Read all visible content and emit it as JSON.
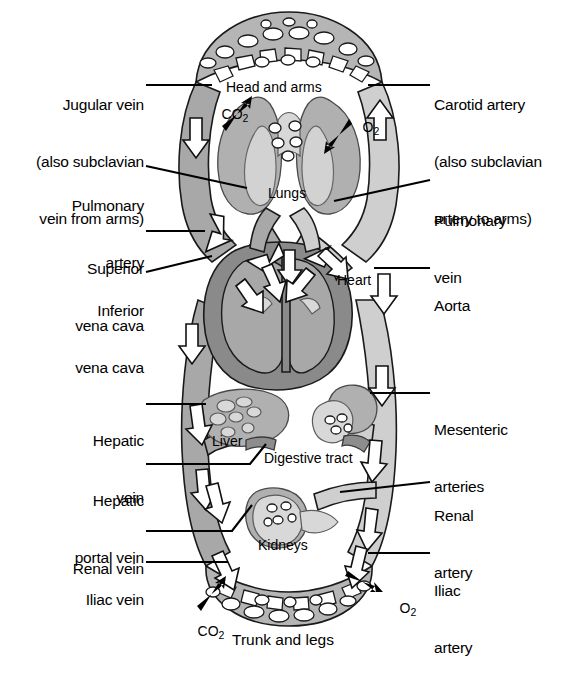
{
  "diagram": {
    "colors": {
      "vein_fill": "#a8a8a8",
      "artery_fill": "#cfcfcf",
      "capillary_fill": "#b5b5b5",
      "organ_mid": "#b0b0b0",
      "organ_dark": "#8d8d8d",
      "organ_light": "#d8d8d8",
      "heart_muscle": "#8a8a8a",
      "heart_chamber": "#a0a0a0",
      "outline": "#1a1a1a",
      "arrow_fill": "#ffffff",
      "text": "#000000",
      "background": "#ffffff"
    }
  },
  "labels": {
    "left": [
      {
        "id": "jugular-vein",
        "lines": [
          "Jugular vein",
          "(also subclavian",
          "vein from arms)"
        ],
        "x": 12,
        "y": 56,
        "line_y": 85,
        "line_x1": 146,
        "line_x2": 210
      },
      {
        "id": "pulmonary-artery",
        "lines": [
          "Pulmonary",
          "artery"
        ],
        "x": 58,
        "y": 160,
        "line_y": 172,
        "line_x1": 146,
        "line_x2": 243
      },
      {
        "id": "superior-vena-cava",
        "lines": [
          "Superior",
          "vena cava"
        ],
        "x": 58,
        "y": 221,
        "line_y": 231,
        "line_x1": 146,
        "line_x2": 205
      },
      {
        "id": "inferior-vena-cava",
        "lines": [
          "Inferior",
          "vena cava"
        ],
        "x": 58,
        "y": 265,
        "line_y": 275,
        "line_x1": 146,
        "line_x2": 211
      },
      {
        "id": "hepatic-vein",
        "lines": [
          "Hepatic",
          "vein"
        ],
        "x": 58,
        "y": 382,
        "line_y": 404,
        "line_x1": 146,
        "line_x2": 205
      },
      {
        "id": "hepatic-portal-vein",
        "lines": [
          "Hepatic",
          "portal vein"
        ],
        "x": 40,
        "y": 451,
        "line_y": 464,
        "line_x1": 146,
        "line_x2": 275
      },
      {
        "id": "renal-vein",
        "lines": [
          "Renal vein"
        ],
        "x": 58,
        "y": 521,
        "line_y": 531,
        "line_x1": 146,
        "line_x2": 240
      },
      {
        "id": "iliac-vein",
        "lines": [
          "Iliac vein"
        ],
        "x": 58,
        "y": 552,
        "line_y": 562,
        "line_x1": 146,
        "line_x2": 228
      }
    ],
    "right": [
      {
        "id": "carotid-artery",
        "lines": [
          "Carotid artery",
          "(also subclavian",
          "artery to arms)"
        ],
        "x": 435,
        "y": 56,
        "line_y": 85,
        "line_x1": 370,
        "line_x2": 430
      },
      {
        "id": "pulmonary-vein",
        "lines": [
          "Pulmonary",
          "vein"
        ],
        "x": 435,
        "y": 180,
        "line_y": 192,
        "line_x1": 340,
        "line_x2": 430
      },
      {
        "id": "aorta",
        "lines": [
          "Aorta"
        ],
        "x": 435,
        "y": 258,
        "line_y": 268,
        "line_x1": 372,
        "line_x2": 430
      },
      {
        "id": "mesenteric-arteries",
        "lines": [
          "Mesenteric",
          "arteries"
        ],
        "x": 435,
        "y": 382,
        "line_y": 393,
        "line_x1": 370,
        "line_x2": 430
      },
      {
        "id": "renal-artery",
        "lines": [
          "Renal",
          "artery"
        ],
        "x": 435,
        "y": 469,
        "line_y": 482,
        "line_x1": 348,
        "line_x2": 430
      },
      {
        "id": "iliac-artery",
        "lines": [
          "Iliac",
          "artery"
        ],
        "x": 435,
        "y": 543,
        "line_y": 553,
        "line_x1": 368,
        "line_x2": 430
      }
    ],
    "internal": [
      {
        "id": "head-and-arms",
        "text": "Head and arms",
        "x": 231,
        "y": 86
      },
      {
        "id": "lungs",
        "text": "Lungs",
        "x": 272,
        "y": 192
      },
      {
        "id": "heart",
        "text": "Heart",
        "x": 339,
        "y": 280
      },
      {
        "id": "liver",
        "text": "Liver",
        "x": 214,
        "y": 440
      },
      {
        "id": "digestive-tract",
        "text": "Digestive tract",
        "x": 267,
        "y": 457
      },
      {
        "id": "kidneys",
        "text": "Kidneys",
        "x": 262,
        "y": 543
      },
      {
        "id": "trunk-and-legs",
        "text": "Trunk and legs",
        "x": 235,
        "y": 638
      }
    ],
    "gases": [
      {
        "id": "co2-head",
        "text": "CO",
        "sub": "2",
        "x": 209,
        "y": 97
      },
      {
        "id": "o2-head",
        "text": "O",
        "sub": "2",
        "x": 349,
        "y": 110
      },
      {
        "id": "co2-trunk",
        "text": "CO",
        "sub": "2",
        "x": 185,
        "y": 613
      },
      {
        "id": "o2-trunk",
        "text": "O",
        "sub": "2",
        "x": 385,
        "y": 591
      }
    ]
  }
}
